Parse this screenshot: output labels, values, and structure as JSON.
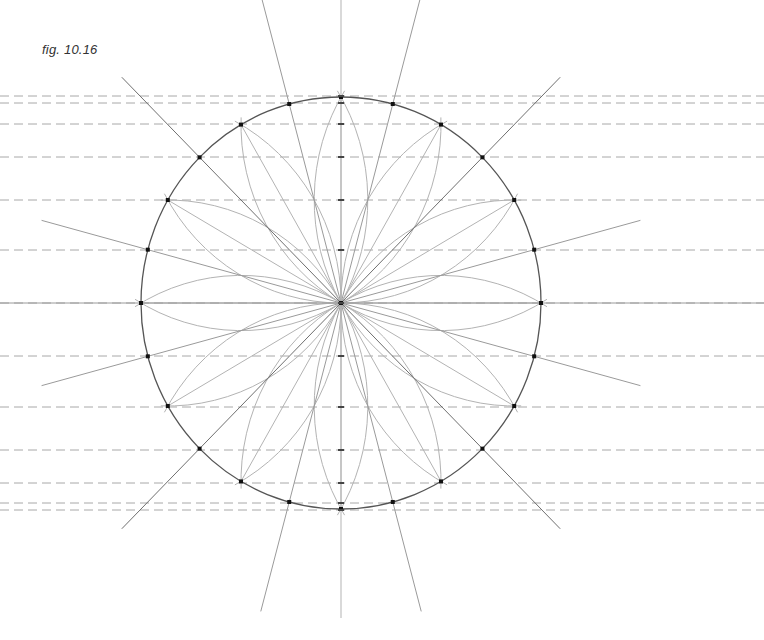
{
  "figure": {
    "label": "fig. 10.16"
  },
  "geometry": {
    "center": [
      341,
      303
    ],
    "radius_x": 200,
    "radius_y": 206,
    "division_step_deg": 15,
    "primary_step_deg": 30,
    "bisector_line_extent": 1.55,
    "arc_radius_factor": 1.0,
    "arc_half_span_deg": 62
  },
  "guide_lines": {
    "y_positions": [
      96,
      103,
      124,
      157,
      200,
      250,
      303,
      356,
      407,
      450,
      483,
      503,
      510
    ],
    "x_start": 0,
    "x_end": 764,
    "dash": "9,5"
  },
  "colors": {
    "circle": "#555555",
    "construction": "#b3b3b3",
    "bisector": "#9a9a9a",
    "dashed_guide": "#a8a8a8",
    "point": "#111111",
    "label": "#333333"
  }
}
